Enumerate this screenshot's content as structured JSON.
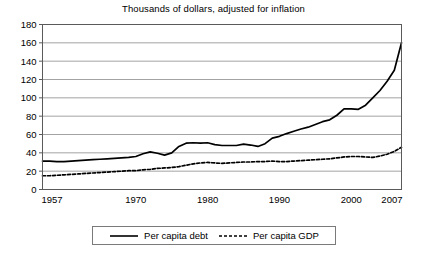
{
  "chart_data": {
    "type": "line",
    "title": "Thousands of dollars, adjusted for inflation",
    "xlabel": "",
    "ylabel": "",
    "xlim": [
      1957,
      2007
    ],
    "ylim": [
      0,
      180
    ],
    "ytick_step": 20,
    "yticks": [
      "0",
      "20",
      "40",
      "60",
      "80",
      "100",
      "120",
      "140",
      "160",
      "180"
    ],
    "xticks": [
      "1957",
      "1970",
      "1980",
      "1990",
      "2000",
      "2007"
    ],
    "grid": "horizontal",
    "legend_position": "bottom",
    "x": [
      1957,
      1958,
      1959,
      1960,
      1961,
      1962,
      1963,
      1964,
      1965,
      1966,
      1967,
      1968,
      1969,
      1970,
      1971,
      1972,
      1973,
      1974,
      1975,
      1976,
      1977,
      1978,
      1979,
      1980,
      1981,
      1982,
      1983,
      1984,
      1985,
      1986,
      1987,
      1988,
      1989,
      1990,
      1991,
      1992,
      1993,
      1994,
      1995,
      1996,
      1997,
      1998,
      1999,
      2000,
      2001,
      2002,
      2003,
      2004,
      2005,
      2006,
      2007
    ],
    "series": [
      {
        "name": "Per capita debt",
        "style": "solid",
        "color": "#000000",
        "values": [
          31,
          31,
          30.5,
          30.5,
          31,
          31.5,
          32,
          32.5,
          33,
          33.5,
          34,
          34.5,
          35,
          36,
          39,
          41,
          39.5,
          37.5,
          40,
          47,
          50.5,
          51,
          50.5,
          51,
          49,
          48,
          48,
          48,
          49.5,
          48.5,
          47,
          50,
          56,
          58,
          61,
          63.5,
          66,
          68,
          71,
          74,
          76,
          81,
          88,
          88,
          87.5,
          92,
          100,
          108,
          118,
          130,
          160
        ]
      },
      {
        "name": "Per capita GDP",
        "style": "dashed",
        "color": "#000000",
        "values": [
          15,
          15,
          15.5,
          16,
          16.5,
          17,
          17.5,
          18,
          18.5,
          19,
          19.5,
          20,
          20.5,
          20.5,
          21.5,
          22,
          23,
          23.5,
          24,
          25,
          26.5,
          28,
          29,
          29.5,
          29,
          28.5,
          29,
          29.5,
          30,
          30,
          30.5,
          30.5,
          31,
          30.5,
          30.5,
          31,
          31.5,
          32,
          32.5,
          33,
          33.5,
          34.5,
          35.5,
          36,
          36,
          35.5,
          35,
          36.5,
          38.5,
          41.5,
          46
        ]
      }
    ]
  },
  "legend": {
    "items": [
      {
        "label": "Per capita debt",
        "style": "solid"
      },
      {
        "label": "Per capita GDP",
        "style": "dashed"
      }
    ]
  }
}
